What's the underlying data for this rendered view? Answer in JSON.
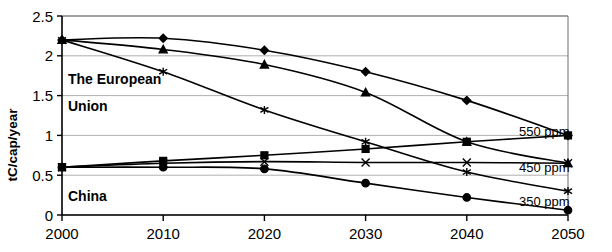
{
  "chart_data": {
    "type": "line",
    "title": "",
    "xlabel": "",
    "ylabel": "tC/cap/year",
    "x": [
      2000,
      2010,
      2020,
      2030,
      2040,
      2050
    ],
    "xticks": [
      "2000",
      "2010",
      "2020",
      "2030",
      "2040",
      "2050"
    ],
    "yticks": [
      "0",
      "0.5",
      "1",
      "1.5",
      "2",
      "2.5"
    ],
    "xlim": [
      2000,
      2050
    ],
    "ylim": [
      0,
      2.5
    ],
    "grid": true,
    "legend_position": "right-inline",
    "series": [
      {
        "name": "The European Union 550 ppm",
        "group": "The European Union",
        "scenario": "550 ppm",
        "marker": "diamond",
        "values": [
          2.2,
          2.22,
          2.07,
          1.8,
          1.44,
          1.0
        ]
      },
      {
        "name": "The European Union 450 ppm",
        "group": "The European Union",
        "scenario": "450 ppm",
        "marker": "triangle",
        "values": [
          2.2,
          2.08,
          1.89,
          1.54,
          0.92,
          0.65
        ]
      },
      {
        "name": "The European Union 350 ppm",
        "group": "The European Union",
        "scenario": "350 ppm",
        "marker": "asterisk",
        "values": [
          2.2,
          1.8,
          1.32,
          0.92,
          0.54,
          0.3
        ]
      },
      {
        "name": "China 550 ppm",
        "group": "China",
        "scenario": "550 ppm",
        "marker": "square",
        "values": [
          0.6,
          0.68,
          0.75,
          0.83,
          0.92,
          1.0
        ]
      },
      {
        "name": "China 450 ppm",
        "group": "China",
        "scenario": "450 ppm",
        "marker": "cross",
        "values": [
          0.6,
          0.65,
          0.67,
          0.66,
          0.66,
          0.65
        ]
      },
      {
        "name": "China 350 ppm",
        "group": "China",
        "scenario": "350 ppm",
        "marker": "circle",
        "values": [
          0.6,
          0.6,
          0.58,
          0.4,
          0.22,
          0.06
        ]
      }
    ],
    "annotations": [
      {
        "text": "The European Union",
        "x": 2000.8,
        "y": 1.55
      },
      {
        "text": "China",
        "x": 2000.8,
        "y": 0.28
      }
    ],
    "legend_entries": [
      {
        "label": "550 ppm",
        "y": 1.12
      },
      {
        "label": "450 ppm",
        "y": 0.62
      },
      {
        "label": "350 ppm",
        "y": 0.19
      }
    ],
    "colors": {
      "line": "#000000",
      "grid": "#9a9a9a",
      "frame": "#6e6e6e",
      "axis": "#000000",
      "background": "#ffffff"
    }
  },
  "labels": {
    "y_axis_title": "tC/cap/year",
    "annotation_eu_line1": "The European",
    "annotation_eu_line2": "Union",
    "annotation_china": "China",
    "legend_550": "550 ppm",
    "legend_450": "450 ppm",
    "legend_350": "350 ppm",
    "ytick_0": "0",
    "ytick_05": "0.5",
    "ytick_1": "1",
    "ytick_15": "1.5",
    "ytick_2": "2",
    "ytick_25": "2.5",
    "xtick_2000": "2000",
    "xtick_2010": "2010",
    "xtick_2020": "2020",
    "xtick_2030": "2030",
    "xtick_2040": "2040",
    "xtick_2050": "2050"
  }
}
